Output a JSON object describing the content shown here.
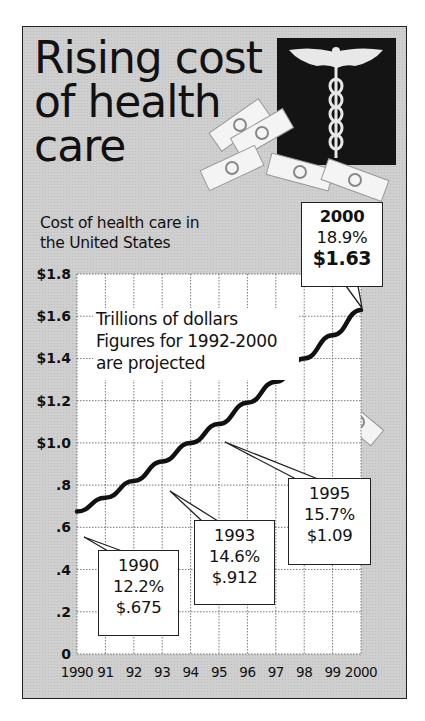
{
  "header": {
    "title_lines": [
      "Rising cost",
      "of health",
      "care"
    ],
    "subtitle_lines": [
      "Cost of health care in",
      "the United States"
    ]
  },
  "illustration": {
    "icon": "caduceus-icon",
    "decor": "dollar-bill-icons"
  },
  "note_lines": [
    "Trillions of dollars",
    "Figures for 1992-2000",
    "are projected"
  ],
  "callouts": [
    {
      "year": "1990",
      "pct": "12.2%",
      "value": "$.675"
    },
    {
      "year": "1993",
      "pct": "14.6%",
      "value": "$.912"
    },
    {
      "year": "1995",
      "pct": "15.7%",
      "value": "$1.09"
    },
    {
      "year": "2000",
      "pct": "18.9%",
      "value": "$1.63"
    }
  ],
  "colors": {
    "background": "#cfcfcf",
    "plot": "#ffffff",
    "line": "#111111",
    "logo": "#141414"
  },
  "chart_data": {
    "type": "line",
    "title": "Rising cost of health care",
    "subtitle": "Cost of health care in the United States",
    "xlabel": "",
    "ylabel": "Trillions of dollars",
    "annotation": "Figures for 1992-2000 are projected",
    "x": [
      1990,
      1991,
      1992,
      1993,
      1994,
      1995,
      1996,
      1997,
      1998,
      1999,
      2000
    ],
    "x_tick_labels": [
      "1990",
      "91",
      "92",
      "93",
      "94",
      "95",
      "96",
      "97",
      "98",
      "99",
      "2000"
    ],
    "y_tick_labels": [
      "0",
      ".2",
      ".4",
      ".6",
      ".8",
      "$1.0",
      "$1.2",
      "$1.4",
      "$1.6",
      "$1.8"
    ],
    "ylim": [
      0,
      1.8
    ],
    "grid": true,
    "series": [
      {
        "name": "Cost of health care (trillions $)",
        "values": [
          0.675,
          0.74,
          0.82,
          0.912,
          1.0,
          1.09,
          1.19,
          1.29,
          1.4,
          1.51,
          1.63
        ]
      }
    ],
    "labeled_points": [
      {
        "x": 1990,
        "y": 0.675,
        "pct_gdp": "12.2%"
      },
      {
        "x": 1993,
        "y": 0.912,
        "pct_gdp": "14.6%"
      },
      {
        "x": 1995,
        "y": 1.09,
        "pct_gdp": "15.7%"
      },
      {
        "x": 2000,
        "y": 1.63,
        "pct_gdp": "18.9%"
      }
    ]
  }
}
